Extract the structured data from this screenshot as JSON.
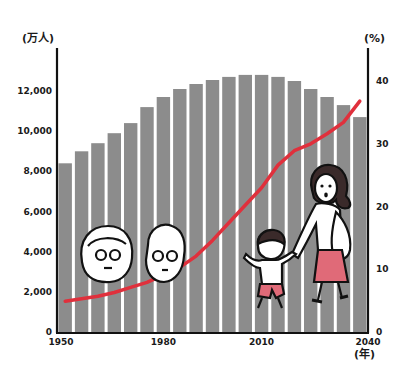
{
  "chart_data": {
    "type": "bar+line",
    "title": "",
    "x": [
      1950,
      1955,
      1960,
      1965,
      1970,
      1975,
      1980,
      1985,
      1990,
      1995,
      2000,
      2005,
      2010,
      2015,
      2020,
      2025,
      2030,
      2035,
      2040
    ],
    "x_tick_labels": [
      "1950",
      "1980",
      "2010",
      "2040"
    ],
    "x_unit_label": "(年)",
    "series": [
      {
        "name": "Population",
        "type": "bar",
        "axis": "left",
        "unit": "万人",
        "color": "#8c8c8c",
        "values": [
          8400,
          9000,
          9400,
          9900,
          10400,
          11200,
          11700,
          12100,
          12350,
          12550,
          12700,
          12800,
          12800,
          12700,
          12500,
          12100,
          11700,
          11300,
          10700
        ]
      },
      {
        "name": "Aging rate",
        "type": "line",
        "axis": "right",
        "unit": "%",
        "color": "#e0303c",
        "values": [
          4.9,
          5.3,
          5.7,
          6.3,
          7.1,
          7.9,
          9.1,
          10.3,
          12.1,
          14.6,
          17.4,
          20.2,
          23.0,
          26.6,
          28.9,
          30.0,
          31.6,
          33.4,
          36.8
        ]
      }
    ],
    "left_axis": {
      "label": "(万人)",
      "ylim": [
        0,
        12000
      ],
      "ticks": [
        "0",
        "2,000",
        "4,000",
        "6,000",
        "8,000",
        "10,000",
        "12,000"
      ]
    },
    "right_axis": {
      "label": "(%)",
      "ylim": [
        0,
        40
      ],
      "ticks": [
        "0",
        "10",
        "20",
        "30",
        "40"
      ]
    },
    "grid": false,
    "legend": "none",
    "annotations": [
      "illustration: elderly couple faces",
      "illustration: mother holding child's hand"
    ]
  },
  "illustration": {
    "skirt_color": "#e06a78",
    "hair_color": "#3a2a2a"
  }
}
